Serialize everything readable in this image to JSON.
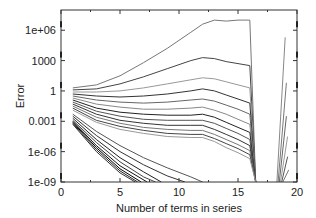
{
  "chart_data": {
    "type": "line",
    "title": "",
    "xlabel": "Number of terms in series",
    "ylabel": "Error",
    "xlim": [
      0,
      20
    ],
    "ylim_log10": [
      -9,
      8
    ],
    "yscale": "log",
    "grid": false,
    "legend": null,
    "x_ticks": [
      0,
      5,
      10,
      15,
      20
    ],
    "x_tick_labels": [
      "0",
      "5",
      "10",
      "15",
      "20"
    ],
    "y_ticks_log10": [
      -9,
      -6,
      -3,
      0,
      3,
      6
    ],
    "y_tick_labels": [
      "1e-09",
      "1e-06",
      "0.001",
      "1",
      "1000",
      "1e+06"
    ],
    "series_upper": [
      {
        "name": "upper-1",
        "color": "#777777",
        "x": [
          1,
          3,
          5,
          7,
          9,
          11,
          12,
          13,
          14,
          15,
          16,
          16.5
        ],
        "log10y": [
          0.3,
          0.6,
          1.5,
          2.8,
          4.2,
          5.8,
          6.6,
          7.0,
          6.9,
          7.0,
          7.0,
          -9
        ]
      },
      {
        "name": "upper-2",
        "color": "#444444",
        "x": [
          1,
          3,
          5,
          7,
          9,
          11,
          12,
          13,
          14,
          15,
          16,
          16.5
        ],
        "log10y": [
          0.1,
          0.2,
          0.7,
          1.4,
          2.2,
          3.0,
          3.3,
          3.2,
          2.9,
          2.7,
          2.5,
          -9
        ]
      },
      {
        "name": "upper-3",
        "color": "#999999",
        "x": [
          1,
          3,
          5,
          7,
          9,
          11,
          12,
          13,
          14,
          15,
          16,
          16.5
        ],
        "log10y": [
          -0.1,
          -0.1,
          0.0,
          0.3,
          0.7,
          1.1,
          1.3,
          1.2,
          0.9,
          0.6,
          0.3,
          -9
        ]
      },
      {
        "name": "upper-4",
        "color": "#333333",
        "x": [
          1,
          3,
          5,
          7,
          9,
          11,
          12,
          13,
          14,
          15,
          16,
          16.5
        ],
        "log10y": [
          -0.3,
          -0.5,
          -0.6,
          -0.5,
          -0.3,
          0.0,
          0.2,
          0.0,
          -0.4,
          -0.8,
          -1.2,
          -9
        ]
      },
      {
        "name": "upper-5",
        "color": "#666666",
        "x": [
          1,
          3,
          5,
          7,
          9,
          11,
          12,
          13,
          14,
          15,
          16,
          16.5
        ],
        "log10y": [
          -0.5,
          -0.9,
          -1.1,
          -1.2,
          -1.1,
          -0.9,
          -0.8,
          -1.0,
          -1.4,
          -1.8,
          -2.3,
          -9
        ]
      },
      {
        "name": "upper-6",
        "color": "#888888",
        "x": [
          1,
          3,
          5,
          7,
          9,
          11,
          12,
          13,
          14,
          15,
          16,
          16.5
        ],
        "log10y": [
          -0.7,
          -1.3,
          -1.6,
          -1.8,
          -1.8,
          -1.7,
          -1.6,
          -1.9,
          -2.3,
          -2.8,
          -3.3,
          -9
        ]
      },
      {
        "name": "upper-7",
        "color": "#222222",
        "x": [
          1,
          3,
          5,
          7,
          9,
          11,
          12,
          13,
          14,
          15,
          16,
          16.5
        ],
        "log10y": [
          -0.9,
          -1.7,
          -2.1,
          -2.3,
          -2.4,
          -2.4,
          -2.3,
          -2.6,
          -3.1,
          -3.6,
          -4.1,
          -9
        ]
      },
      {
        "name": "upper-8",
        "color": "#555555",
        "x": [
          1,
          3,
          5,
          7,
          9,
          11,
          12,
          13,
          14,
          15,
          16,
          16.5
        ],
        "log10y": [
          -1.1,
          -2.0,
          -2.5,
          -2.8,
          -2.9,
          -2.9,
          -2.9,
          -3.2,
          -3.7,
          -4.2,
          -4.8,
          -9
        ]
      },
      {
        "name": "upper-9",
        "color": "#333333",
        "x": [
          1,
          3,
          5,
          7,
          9,
          11,
          12,
          13,
          14,
          15,
          16,
          16.5
        ],
        "log10y": [
          -1.3,
          -2.3,
          -2.9,
          -3.2,
          -3.4,
          -3.4,
          -3.4,
          -3.8,
          -4.3,
          -4.8,
          -5.4,
          -9
        ]
      },
      {
        "name": "upper-10",
        "color": "#777777",
        "x": [
          1,
          3,
          5,
          7,
          9,
          11,
          12,
          13,
          14,
          15,
          16,
          16.5
        ],
        "log10y": [
          -1.5,
          -2.6,
          -3.2,
          -3.6,
          -3.8,
          -3.9,
          -3.9,
          -4.3,
          -4.8,
          -5.3,
          -5.9,
          -9
        ]
      },
      {
        "name": "upper-11",
        "color": "#444444",
        "x": [
          1,
          3,
          5,
          7,
          9,
          11,
          12,
          13,
          14,
          15,
          16,
          16.5
        ],
        "log10y": [
          -1.7,
          -2.9,
          -3.5,
          -3.9,
          -4.2,
          -4.3,
          -4.3,
          -4.7,
          -5.2,
          -5.7,
          -6.3,
          -9
        ]
      },
      {
        "name": "upper-12",
        "color": "#999999",
        "x": [
          1,
          3,
          5,
          7,
          9,
          11,
          12,
          13,
          14,
          15,
          16,
          16.5
        ],
        "log10y": [
          -1.9,
          -3.1,
          -3.8,
          -4.2,
          -4.5,
          -4.6,
          -4.6,
          -5.0,
          -5.6,
          -6.1,
          -6.7,
          -9
        ]
      }
    ],
    "series_lower": [
      {
        "name": "lower-1",
        "color": "#555555",
        "x": [
          1,
          3,
          5,
          7,
          9,
          11,
          12
        ],
        "log10y": [
          -2.3,
          -4.0,
          -5.4,
          -6.6,
          -7.6,
          -8.5,
          -9
        ]
      },
      {
        "name": "lower-2",
        "color": "#333333",
        "x": [
          1,
          3,
          5,
          7,
          9,
          10.5
        ],
        "log10y": [
          -2.5,
          -4.4,
          -6.0,
          -7.3,
          -8.4,
          -9
        ]
      },
      {
        "name": "lower-3",
        "color": "#222222",
        "x": [
          1,
          3,
          5,
          7,
          8.5
        ],
        "log10y": [
          -2.7,
          -4.8,
          -6.6,
          -8.0,
          -9
        ]
      },
      {
        "name": "lower-4",
        "color": "#444444",
        "x": [
          1,
          3,
          5,
          7,
          8
        ],
        "log10y": [
          -2.9,
          -5.1,
          -7.0,
          -8.5,
          -9
        ]
      },
      {
        "name": "lower-5",
        "color": "#111111",
        "x": [
          1,
          3,
          5,
          7.3
        ],
        "log10y": [
          -3.0,
          -5.4,
          -7.4,
          -9
        ]
      },
      {
        "name": "lower-6",
        "color": "#000000",
        "x": [
          1,
          3,
          5,
          6.8
        ],
        "log10y": [
          -3.1,
          -5.6,
          -7.7,
          -9
        ]
      },
      {
        "name": "lower-7",
        "color": "#222222",
        "x": [
          1,
          3,
          5,
          6.5
        ],
        "log10y": [
          -3.2,
          -5.8,
          -7.9,
          -9
        ]
      },
      {
        "name": "lower-8",
        "color": "#333333",
        "x": [
          1,
          3,
          5,
          6.3
        ],
        "log10y": [
          -3.3,
          -6.0,
          -8.1,
          -9
        ]
      }
    ],
    "series_right": [
      {
        "name": "right-1",
        "color": "#888888",
        "x": [
          18.3,
          19.0
        ],
        "log10y": [
          -9,
          5.3
        ]
      },
      {
        "name": "right-2",
        "color": "#777777",
        "x": [
          18.4,
          19.1
        ],
        "log10y": [
          -9,
          0.8
        ]
      },
      {
        "name": "right-3",
        "color": "#666666",
        "x": [
          18.5,
          19.1
        ],
        "log10y": [
          -9,
          -2.5
        ]
      },
      {
        "name": "right-4",
        "color": "#999999",
        "x": [
          18.6,
          19.2
        ],
        "log10y": [
          -9,
          -4.5
        ]
      },
      {
        "name": "right-5",
        "color": "#555555",
        "x": [
          18.7,
          19.2
        ],
        "log10y": [
          -9,
          -6.5
        ]
      },
      {
        "name": "right-6",
        "color": "#777777",
        "x": [
          18.8,
          19.3
        ],
        "log10y": [
          -9,
          -7.8
        ]
      }
    ]
  }
}
